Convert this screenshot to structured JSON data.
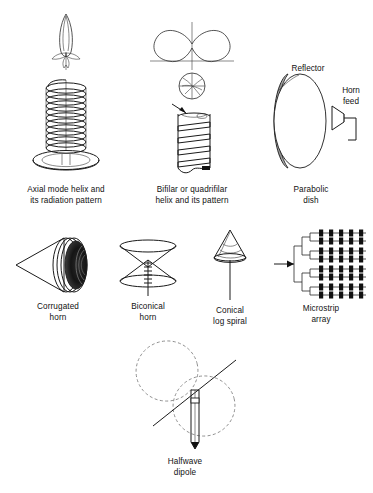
{
  "figure": {
    "background": "#ffffff",
    "ink": "#1a1a1a",
    "dashed_pattern_color": "#8d8d8d",
    "width": 373,
    "height": 493
  },
  "items": [
    {
      "id": "axial-mode-helix",
      "caption": "Axial mode helix and\nits radiation pattern",
      "art": "helical antenna coil on circular ground plane with narrow endfire radiation lobe above"
    },
    {
      "id": "bifilar-quadrifilar-helix",
      "caption": "Bifilar or quadrifilar\nhelix and its pattern",
      "art": "kidney shaped radiation pattern, circular cross section view, and tall square helix winding"
    },
    {
      "id": "parabolic-dish",
      "caption": "Parabolic\ndish",
      "art": "elliptical reflector dish with shaded rim and offset horn feed"
    },
    {
      "id": "corrugated-horn",
      "caption": "Corrugated\nhorn",
      "art": "conical horn pointing left with concentric corrugation rings and dark aperture"
    },
    {
      "id": "biconical-horn",
      "caption": "Biconical\nhorn",
      "art": "two opposed cones meeting at a point with striped vertical feed line"
    },
    {
      "id": "conical-log-spiral",
      "caption": "Conical\nlog spiral",
      "art": "cone with logarithmic spiral windings mounted on a thin vertical mast"
    },
    {
      "id": "microstrip-array",
      "caption": "Microstrip\narray",
      "art": "corporate feed network driving an 8 by 5 grid of rectangular patch elements",
      "grid_rows": 8,
      "grid_columns": 5
    },
    {
      "id": "halfwave-dipole",
      "caption": "Halfwave\ndipole",
      "art": "vertical dipole element with dashed figure eight radiation pattern and diagonal axis line"
    }
  ],
  "inline_labels": {
    "reflector": "Reflector",
    "horn_feed": "Horn\nfeed"
  }
}
